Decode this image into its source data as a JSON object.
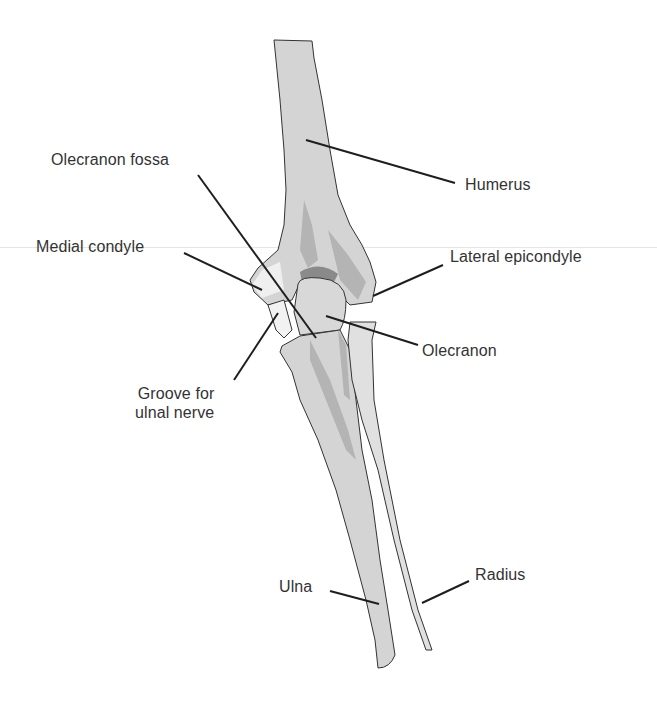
{
  "diagram": {
    "colors": {
      "bone_fill": "#d4d4d4",
      "bone_shadow": "#b4b4b4",
      "bone_highlight": "#efefef",
      "fossa": "#8a8a8a",
      "outline": "#333333",
      "leader": "#1e1e1e",
      "text": "#333333"
    },
    "labels": [
      {
        "id": "olecranon-fossa",
        "text": "Olecranon fossa"
      },
      {
        "id": "humerus",
        "text": "Humerus"
      },
      {
        "id": "medial-condyle",
        "text": "Medial condyle"
      },
      {
        "id": "lateral-epicondyle",
        "text": "Lateral epicondyle"
      },
      {
        "id": "olecranon",
        "text": "Olecranon"
      },
      {
        "id": "groove-ulnal-nerve",
        "text": "Groove for\nulnal nerve"
      },
      {
        "id": "ulna",
        "text": "Ulna"
      },
      {
        "id": "radius",
        "text": "Radius"
      }
    ]
  }
}
